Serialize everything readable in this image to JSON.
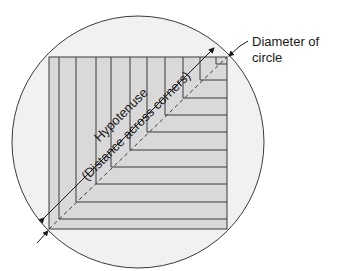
{
  "diagram": {
    "labels": {
      "diameter_line1": "Diameter of",
      "diameter_line2": "circle",
      "hypotenuse": "Hypotenuse",
      "distance": "(Distance across corners)"
    },
    "colors": {
      "circle_fill": "#f1f1f1",
      "square_fill": "#d9d9d9",
      "stroke": "#3a3a3a"
    }
  }
}
